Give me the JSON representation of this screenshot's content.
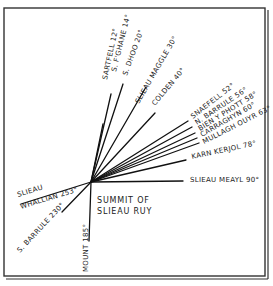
{
  "diagram": {
    "center_label_lines": [
      "SUMMIT OF",
      "SLIEAU RUY"
    ],
    "bearings": [
      {
        "name": "SARTFELL",
        "angle": "12°"
      },
      {
        "name": "S. F'GHANE",
        "angle": "14°"
      },
      {
        "name": "S. DHOO",
        "angle": "20°"
      },
      {
        "name": "SLIEAU MAGGLE",
        "angle": "30°"
      },
      {
        "name": "COLDEN",
        "angle": "40°"
      },
      {
        "name": "SNAEFELL",
        "angle": "52°"
      },
      {
        "name": "N. BARRULE",
        "angle": "56°"
      },
      {
        "name": "BIEN Y PHOTT",
        "angle": "58°"
      },
      {
        "name": "CARRAGHYN",
        "angle": "60°"
      },
      {
        "name": "MULLAGH OUYR",
        "angle": "63°"
      },
      {
        "name": "KARN KERJOL",
        "angle": "78°"
      },
      {
        "name": "SLIEAU MEAYL",
        "angle": "90°"
      },
      {
        "name": "MOUNT",
        "angle": "185°"
      },
      {
        "name": "S. BARRULE",
        "angle": "230°"
      },
      {
        "name": "SLIEAU WHALLIAN",
        "angle": "253°"
      }
    ]
  },
  "labels": {
    "sartfell": "SARTFELL 12°",
    "sfghane": "S. F'GHANE 14°",
    "sdhoo": "S. DHOO 20°",
    "maggle": "SLIEAU MAGGLE 30°",
    "colden": "COLDEN 40°",
    "snaefell": "SNAEFELL 52°",
    "nbarrule": "N. BARRULE 56°",
    "bien": "BIEN Y PHOTT 58°",
    "carraghyn": "CARRAGHYN 60°",
    "mullagh": "MULLAGH OUYR 63°",
    "karn": "KARN KERJOL 78°",
    "meayl": "SLIEAU MEAYL 90°",
    "mount": "MOUNT 185°",
    "sbarrule": "S. BARRULE 230°",
    "whallian1": "SLIEAU",
    "whallian2": "WHALLIAN 253°",
    "center1": "SUMMIT OF",
    "center2": "SLIEAU RUY"
  }
}
